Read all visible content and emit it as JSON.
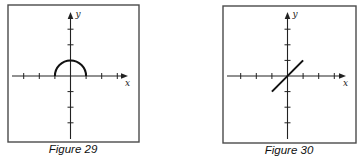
{
  "figures": [
    {
      "id": "figure-29",
      "caption": "Figure 29",
      "x_label": "x",
      "y_label": "y",
      "x_ticks": [
        -3,
        -2,
        -1,
        1,
        2,
        3
      ],
      "y_ticks": [
        -3,
        -2,
        -1,
        1,
        2,
        3
      ],
      "curve": {
        "type": "semicircle",
        "description": "upper half of circle x^2 + y^2 = 1",
        "center": [
          0,
          0
        ],
        "radius": 1,
        "x_range": [
          -1,
          1
        ]
      }
    },
    {
      "id": "figure-30",
      "caption": "Figure 30",
      "x_label": "x",
      "y_label": "y",
      "x_ticks": [
        -3,
        -2,
        -1,
        1,
        2,
        3
      ],
      "y_ticks": [
        -3,
        -2,
        -1,
        1,
        2,
        3
      ],
      "curve": {
        "type": "segment",
        "description": "line y = x on [-1, 1]",
        "from": [
          -1,
          -1
        ],
        "to": [
          1,
          1
        ]
      }
    }
  ]
}
